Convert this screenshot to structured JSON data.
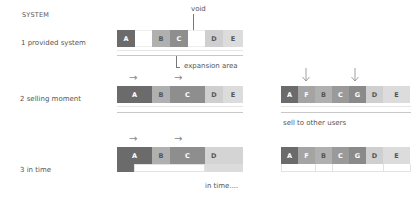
{
  "title": "SYSTEM",
  "rows": [
    {
      "label": "1 provided system"
    },
    {
      "label": "2 selling moment"
    },
    {
      "label": "3 in time"
    }
  ],
  "annotations": {
    "void": "void",
    "expansion": "expansion area",
    "sell": "sell to other users",
    "in_time": "in time...."
  },
  "colors": {
    "A": "#6b6b6b",
    "B": "#b0b0b0",
    "C": "#8e8e8e",
    "D": "#cfcfcf",
    "E": "#dcdcdc",
    "F": "#a4a4a4",
    "G": "#8a8a8a",
    "void": "#ffffff"
  },
  "diagram": {
    "row1_left": [
      "A",
      "",
      "B",
      "C",
      "",
      "D",
      "E"
    ],
    "row2_left": [
      "A",
      "B",
      "C",
      "D",
      "E"
    ],
    "row2_right": [
      "A",
      "F",
      "B",
      "C",
      "G",
      "D",
      "E"
    ],
    "row3_left": [
      "A",
      "B",
      "C",
      "D"
    ],
    "row3_right": [
      "A",
      "F",
      "B",
      "C",
      "G",
      "D",
      "E"
    ]
  }
}
